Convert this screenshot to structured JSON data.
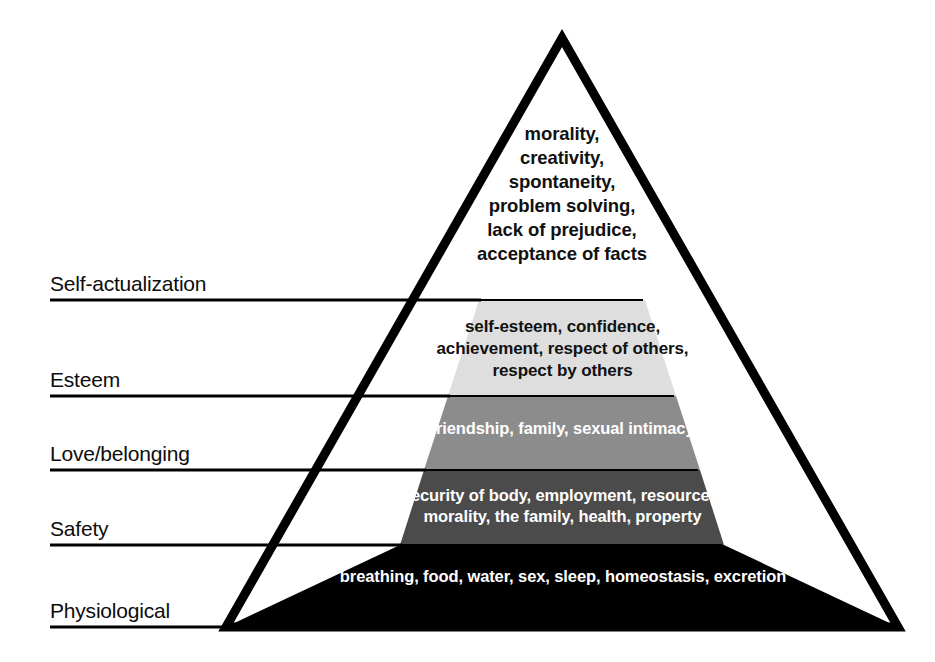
{
  "diagram": {
    "type": "pyramid",
    "background_color": "#ffffff",
    "outline_color": "#000000",
    "levels": [
      {
        "id": "self-actualization",
        "rank": 5,
        "label": "Self-actualization",
        "contents": "morality,\ncreativity,\nspontaneity,\nproblem solving,\nlack of prejudice,\nacceptance of facts",
        "items": [
          "morality",
          "creativity",
          "spontaneity",
          "problem solving",
          "lack of prejudice",
          "acceptance of facts"
        ],
        "fill_color": "#ffffff",
        "text_color": "#111111"
      },
      {
        "id": "esteem",
        "rank": 4,
        "label": "Esteem",
        "contents": "self-esteem, confidence,\nachievement, respect of others,\nrespect by others",
        "items": [
          "self-esteem",
          "confidence",
          "achievement",
          "respect of others",
          "respect by others"
        ],
        "fill_color": "#dedede",
        "text_color": "#111111"
      },
      {
        "id": "love-belonging",
        "rank": 3,
        "label": "Love/belonging",
        "contents": "friendship, family, sexual intimacy",
        "items": [
          "friendship",
          "family",
          "sexual intimacy"
        ],
        "fill_color": "#8c8c8c",
        "text_color": "#ffffff"
      },
      {
        "id": "safety",
        "rank": 2,
        "label": "Safety",
        "contents": "security of body, employment, resources,\nmorality, the family, health, property",
        "items": [
          "security of body",
          "employment",
          "resources",
          "morality",
          "the family",
          "health",
          "property"
        ],
        "fill_color": "#4b4b4b",
        "text_color": "#ffffff"
      },
      {
        "id": "physiological",
        "rank": 1,
        "label": "Physiological",
        "contents": "breathing, food, water, sex, sleep, homeostasis, excretion",
        "items": [
          "breathing",
          "food",
          "water",
          "sex",
          "sleep",
          "homeostasis",
          "excretion"
        ],
        "fill_color": "#000000",
        "text_color": "#ffffff"
      }
    ]
  }
}
